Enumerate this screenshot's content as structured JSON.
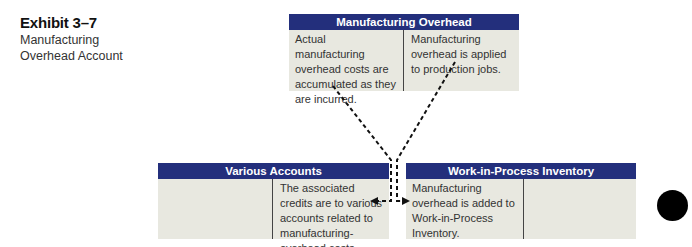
{
  "exhibit": {
    "number": "Exhibit 3–7",
    "caption": "Manufacturing Overhead Account"
  },
  "accounts": {
    "manufacturing_overhead": {
      "title": "Manufacturing Overhead",
      "debit_text": "Actual manufacturing overhead costs are accumulated as they are incurred.",
      "credit_text": "Manufacturing overhead is applied to production jobs."
    },
    "various_accounts": {
      "title": "Various Accounts",
      "debit_text": "",
      "credit_text": "The associated credits are to various accounts related to manufacturing-overhead costs."
    },
    "wip_inventory": {
      "title": "Work-in-Process Inventory",
      "debit_text": "Manufacturing overhead is added to Work-in-Process Inventory.",
      "credit_text": ""
    }
  },
  "colors": {
    "header_bg": "#232f7c",
    "body_bg": "#e8e8e0",
    "connector": "#111111"
  },
  "connectors": [
    {
      "from": "manufacturing_overhead.debit",
      "to": "various_accounts.credit",
      "style": "dashed-arrow"
    },
    {
      "from": "manufacturing_overhead.credit",
      "to": "wip_inventory.debit",
      "style": "dashed-arrow"
    }
  ]
}
